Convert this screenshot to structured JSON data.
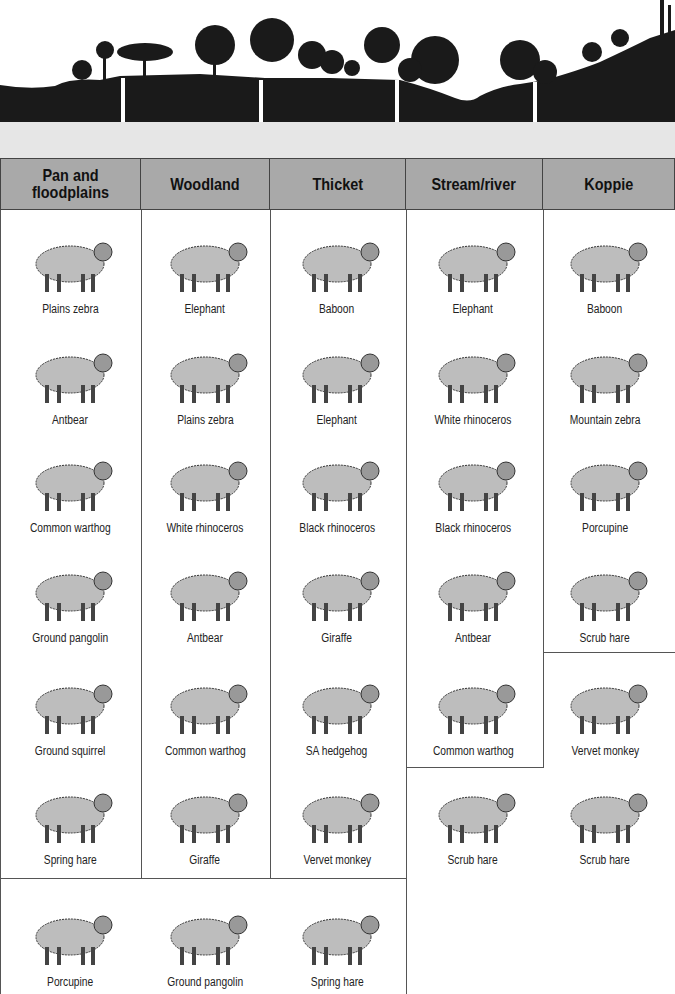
{
  "headers": [
    "Pan and floodplains",
    "Woodland",
    "Thicket",
    "Stream/river",
    "Koppie"
  ],
  "columns": [
    {
      "habitat": "Pan and floodplains",
      "animals": [
        "Plains zebra",
        "Antbear",
        "Common warthog",
        "Ground pangolin",
        "Ground squirrel",
        "Spring hare",
        "Porcupine"
      ]
    },
    {
      "habitat": "Woodland",
      "animals": [
        "Elephant",
        "Plains zebra",
        "White rhinoceros",
        "Antbear",
        "Common warthog",
        "Giraffe",
        "Ground pangolin"
      ]
    },
    {
      "habitat": "Thicket",
      "animals": [
        "Baboon",
        "Elephant",
        "Black rhinoceros",
        "Giraffe",
        "SA hedgehog",
        "Vervet monkey",
        "Spring hare"
      ]
    },
    {
      "habitat": "Stream/river",
      "animals": [
        "Elephant",
        "White rhinoceros",
        "Black rhinoceros",
        "Antbear",
        "Common warthog",
        "Scrub hare"
      ]
    },
    {
      "habitat": "Koppie",
      "animals": [
        "Baboon",
        "Mountain zebra",
        "Porcupine",
        "Scrub hare",
        "Vervet monkey",
        "Scrub hare"
      ]
    }
  ],
  "colors": {
    "header_bg": "#a9a9a9",
    "landscape": "#1a1a1a",
    "band": "#e6e6e6",
    "border": "#555555"
  }
}
